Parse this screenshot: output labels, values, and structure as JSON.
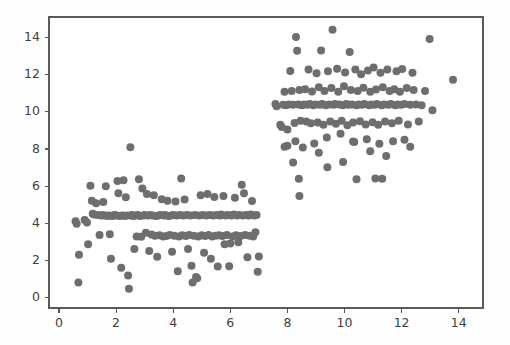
{
  "chart_data": {
    "type": "scatter",
    "title": "",
    "subtitle": "",
    "xlabel": "",
    "ylabel": "",
    "xlim": [
      -0.35,
      14.85
    ],
    "ylim": [
      -0.55,
      15.1
    ],
    "xticks": [
      0,
      2,
      4,
      6,
      8,
      10,
      12,
      14
    ],
    "yticks": [
      0,
      2,
      4,
      6,
      8,
      10,
      12,
      14
    ],
    "xticklabels": [
      "0",
      "2",
      "4",
      "6",
      "8",
      "10",
      "12",
      "14"
    ],
    "yticklabels": [
      "0",
      "2",
      "4",
      "6",
      "8",
      "10",
      "12",
      "14"
    ],
    "grid": false,
    "legend": null,
    "legend_position": "none",
    "marker": "circle",
    "marker_size": 8,
    "marker_color": "#6e6e6e",
    "background_color": "#ffffff",
    "frame_color": "#5a5a5a",
    "series": [
      {
        "name": "cluster-lower-left",
        "color": "#6e6e6e",
        "points": [
          [
            0.58,
            4.12
          ],
          [
            0.62,
            3.98
          ],
          [
            0.7,
            2.32
          ],
          [
            0.68,
            0.82
          ],
          [
            0.9,
            4.18
          ],
          [
            0.98,
            4.05
          ],
          [
            1.02,
            2.88
          ],
          [
            1.1,
            6.02
          ],
          [
            1.15,
            5.22
          ],
          [
            1.18,
            4.52
          ],
          [
            1.22,
            4.48
          ],
          [
            1.3,
            5.08
          ],
          [
            1.34,
            4.45
          ],
          [
            1.42,
            3.38
          ],
          [
            1.48,
            4.42
          ],
          [
            1.52,
            4.45
          ],
          [
            1.55,
            5.15
          ],
          [
            1.6,
            4.42
          ],
          [
            1.64,
            6.0
          ],
          [
            1.7,
            4.4
          ],
          [
            1.74,
            4.42
          ],
          [
            1.78,
            3.42
          ],
          [
            1.82,
            2.1
          ],
          [
            1.86,
            4.4
          ],
          [
            1.9,
            4.42
          ],
          [
            1.95,
            4.45
          ],
          [
            2.0,
            4.42
          ],
          [
            2.05,
            6.28
          ],
          [
            2.08,
            5.62
          ],
          [
            2.12,
            4.4
          ],
          [
            2.18,
            1.62
          ],
          [
            2.22,
            4.42
          ],
          [
            2.26,
            6.32
          ],
          [
            2.3,
            4.4
          ],
          [
            2.34,
            5.4
          ],
          [
            2.38,
            4.42
          ],
          [
            2.42,
            1.2
          ],
          [
            2.45,
            0.48
          ],
          [
            2.5,
            8.1
          ],
          [
            2.52,
            4.42
          ],
          [
            2.56,
            4.45
          ],
          [
            2.6,
            4.4
          ],
          [
            2.64,
            2.62
          ],
          [
            2.68,
            4.42
          ],
          [
            2.72,
            3.3
          ],
          [
            2.76,
            4.45
          ],
          [
            2.8,
            6.38
          ],
          [
            2.84,
            4.4
          ],
          [
            2.88,
            3.28
          ],
          [
            2.92,
            5.88
          ],
          [
            2.96,
            4.42
          ],
          [
            3.0,
            4.45
          ],
          [
            3.04,
            3.5
          ],
          [
            3.08,
            5.58
          ],
          [
            3.12,
            4.42
          ],
          [
            3.16,
            2.52
          ],
          [
            3.2,
            4.45
          ],
          [
            3.24,
            3.4
          ],
          [
            3.28,
            4.42
          ],
          [
            3.32,
            5.52
          ],
          [
            3.36,
            3.34
          ],
          [
            3.4,
            4.4
          ],
          [
            3.44,
            2.2
          ],
          [
            3.48,
            4.42
          ],
          [
            3.52,
            3.36
          ],
          [
            3.56,
            4.45
          ],
          [
            3.6,
            5.3
          ],
          [
            3.64,
            3.3
          ],
          [
            3.68,
            4.42
          ],
          [
            3.72,
            4.45
          ],
          [
            3.76,
            3.32
          ],
          [
            3.8,
            5.22
          ],
          [
            3.84,
            4.4
          ],
          [
            3.88,
            3.38
          ],
          [
            3.92,
            4.42
          ],
          [
            3.96,
            2.48
          ],
          [
            4.0,
            4.45
          ],
          [
            4.04,
            3.34
          ],
          [
            4.08,
            5.18
          ],
          [
            4.12,
            4.42
          ],
          [
            4.16,
            1.42
          ],
          [
            4.2,
            3.3
          ],
          [
            4.24,
            4.45
          ],
          [
            4.28,
            6.42
          ],
          [
            4.32,
            3.36
          ],
          [
            4.36,
            4.42
          ],
          [
            4.4,
            5.28
          ],
          [
            4.44,
            3.32
          ],
          [
            4.48,
            4.45
          ],
          [
            4.52,
            2.62
          ],
          [
            4.56,
            3.38
          ],
          [
            4.6,
            4.42
          ],
          [
            4.64,
            1.72
          ],
          [
            4.68,
            0.82
          ],
          [
            4.72,
            3.34
          ],
          [
            4.76,
            4.45
          ],
          [
            4.8,
            1.12
          ],
          [
            4.84,
            1.05
          ],
          [
            4.88,
            3.3
          ],
          [
            4.92,
            4.42
          ],
          [
            4.96,
            5.52
          ],
          [
            5.0,
            3.36
          ],
          [
            5.04,
            4.45
          ],
          [
            5.08,
            2.42
          ],
          [
            5.12,
            3.32
          ],
          [
            5.16,
            4.42
          ],
          [
            5.2,
            5.58
          ],
          [
            5.24,
            3.38
          ],
          [
            5.28,
            4.45
          ],
          [
            5.32,
            2.1
          ],
          [
            5.36,
            3.3
          ],
          [
            5.4,
            4.42
          ],
          [
            5.44,
            5.42
          ],
          [
            5.48,
            3.34
          ],
          [
            5.52,
            4.45
          ],
          [
            5.56,
            1.68
          ],
          [
            5.6,
            3.36
          ],
          [
            5.64,
            4.42
          ],
          [
            5.68,
            4.48
          ],
          [
            5.72,
            3.32
          ],
          [
            5.76,
            5.48
          ],
          [
            5.8,
            2.88
          ],
          [
            5.84,
            4.42
          ],
          [
            5.88,
            3.38
          ],
          [
            5.92,
            4.45
          ],
          [
            5.96,
            1.7
          ],
          [
            6.0,
            2.92
          ],
          [
            6.04,
            4.42
          ],
          [
            6.08,
            3.3
          ],
          [
            6.12,
            4.48
          ],
          [
            6.16,
            5.38
          ],
          [
            6.2,
            3.36
          ],
          [
            6.24,
            4.42
          ],
          [
            6.28,
            2.98
          ],
          [
            6.32,
            4.45
          ],
          [
            6.36,
            3.32
          ],
          [
            6.4,
            6.08
          ],
          [
            6.44,
            4.42
          ],
          [
            6.48,
            5.62
          ],
          [
            6.52,
            3.38
          ],
          [
            6.56,
            4.45
          ],
          [
            6.6,
            2.18
          ],
          [
            6.64,
            4.42
          ],
          [
            6.68,
            3.34
          ],
          [
            6.72,
            4.48
          ],
          [
            6.76,
            5.2
          ],
          [
            6.8,
            3.3
          ],
          [
            6.84,
            4.42
          ],
          [
            6.88,
            3.52
          ],
          [
            6.92,
            4.45
          ],
          [
            6.96,
            1.4
          ],
          [
            7.0,
            2.22
          ]
        ]
      },
      {
        "name": "cluster-upper-right",
        "color": "#6e6e6e",
        "points": [
          [
            7.58,
            10.42
          ],
          [
            7.62,
            10.3
          ],
          [
            7.75,
            9.3
          ],
          [
            7.8,
            9.18
          ],
          [
            7.85,
            10.38
          ],
          [
            7.9,
            11.08
          ],
          [
            7.95,
            10.35
          ],
          [
            8.0,
            9.05
          ],
          [
            8.05,
            10.4
          ],
          [
            8.1,
            12.2
          ],
          [
            8.15,
            11.12
          ],
          [
            8.2,
            10.38
          ],
          [
            8.25,
            9.4
          ],
          [
            8.28,
            8.42
          ],
          [
            8.3,
            14.02
          ],
          [
            8.34,
            13.28
          ],
          [
            8.38,
            10.4
          ],
          [
            8.42,
            11.18
          ],
          [
            8.46,
            9.52
          ],
          [
            8.5,
            10.36
          ],
          [
            8.54,
            8.08
          ],
          [
            8.58,
            10.4
          ],
          [
            8.62,
            11.22
          ],
          [
            8.66,
            9.48
          ],
          [
            8.7,
            10.38
          ],
          [
            8.74,
            12.28
          ],
          [
            8.78,
            10.42
          ],
          [
            8.82,
            9.38
          ],
          [
            8.86,
            11.1
          ],
          [
            8.9,
            10.36
          ],
          [
            8.94,
            8.3
          ],
          [
            8.98,
            10.4
          ],
          [
            9.02,
            12.08
          ],
          [
            9.06,
            9.42
          ],
          [
            9.1,
            11.32
          ],
          [
            9.14,
            10.38
          ],
          [
            9.18,
            13.3
          ],
          [
            9.22,
            10.42
          ],
          [
            9.26,
            9.3
          ],
          [
            9.3,
            11.12
          ],
          [
            9.34,
            10.36
          ],
          [
            9.38,
            8.62
          ],
          [
            9.42,
            12.18
          ],
          [
            9.46,
            10.4
          ],
          [
            9.5,
            9.48
          ],
          [
            9.54,
            11.28
          ],
          [
            9.58,
            14.42
          ],
          [
            9.62,
            10.38
          ],
          [
            9.66,
            10.42
          ],
          [
            9.7,
            9.36
          ],
          [
            9.74,
            12.32
          ],
          [
            9.78,
            11.08
          ],
          [
            9.82,
            10.4
          ],
          [
            9.86,
            8.82
          ],
          [
            9.9,
            9.52
          ],
          [
            9.94,
            10.36
          ],
          [
            9.98,
            11.38
          ],
          [
            10.02,
            12.12
          ],
          [
            10.06,
            10.42
          ],
          [
            10.1,
            9.28
          ],
          [
            10.14,
            10.38
          ],
          [
            10.18,
            13.22
          ],
          [
            10.22,
            11.18
          ],
          [
            10.26,
            10.4
          ],
          [
            10.3,
            9.42
          ],
          [
            10.34,
            8.38
          ],
          [
            10.38,
            12.28
          ],
          [
            10.42,
            10.36
          ],
          [
            10.46,
            11.12
          ],
          [
            10.5,
            10.4
          ],
          [
            10.54,
            9.5
          ],
          [
            10.58,
            12.02
          ],
          [
            10.62,
            10.38
          ],
          [
            10.66,
            11.3
          ],
          [
            10.7,
            10.42
          ],
          [
            10.74,
            9.32
          ],
          [
            10.78,
            8.52
          ],
          [
            10.82,
            12.22
          ],
          [
            10.86,
            10.36
          ],
          [
            10.9,
            11.08
          ],
          [
            10.94,
            10.4
          ],
          [
            10.98,
            9.44
          ],
          [
            11.02,
            12.38
          ],
          [
            11.06,
            10.38
          ],
          [
            11.1,
            11.2
          ],
          [
            11.14,
            10.42
          ],
          [
            11.18,
            9.3
          ],
          [
            11.22,
            8.28
          ],
          [
            11.26,
            12.1
          ],
          [
            11.3,
            10.36
          ],
          [
            11.34,
            11.32
          ],
          [
            11.38,
            10.4
          ],
          [
            11.42,
            9.48
          ],
          [
            11.46,
            7.62
          ],
          [
            11.5,
            12.28
          ],
          [
            11.54,
            10.38
          ],
          [
            11.58,
            11.12
          ],
          [
            11.62,
            10.42
          ],
          [
            11.66,
            9.38
          ],
          [
            11.7,
            8.42
          ],
          [
            11.74,
            11.22
          ],
          [
            11.78,
            10.36
          ],
          [
            11.82,
            12.18
          ],
          [
            11.86,
            10.4
          ],
          [
            11.9,
            9.52
          ],
          [
            11.94,
            11.08
          ],
          [
            11.98,
            10.38
          ],
          [
            12.02,
            12.3
          ],
          [
            12.1,
            10.42
          ],
          [
            12.18,
            11.28
          ],
          [
            12.22,
            9.32
          ],
          [
            12.3,
            10.38
          ],
          [
            12.38,
            12.1
          ],
          [
            12.42,
            11.18
          ],
          [
            12.5,
            10.4
          ],
          [
            12.6,
            9.48
          ],
          [
            12.7,
            10.36
          ],
          [
            12.82,
            11.12
          ],
          [
            12.98,
            13.92
          ],
          [
            13.08,
            10.08
          ],
          [
            13.8,
            11.72
          ],
          [
            8.2,
            7.28
          ],
          [
            8.4,
            6.4
          ],
          [
            8.42,
            5.48
          ],
          [
            9.1,
            7.8
          ],
          [
            9.4,
            7.02
          ],
          [
            10.3,
            8.4
          ],
          [
            10.42,
            6.38
          ],
          [
            11.08,
            6.42
          ],
          [
            11.32,
            6.4
          ],
          [
            8.0,
            8.18
          ],
          [
            7.9,
            8.12
          ],
          [
            9.95,
            7.3
          ],
          [
            10.9,
            7.88
          ],
          [
            12.1,
            8.5
          ],
          [
            12.3,
            8.12
          ]
        ]
      }
    ]
  }
}
